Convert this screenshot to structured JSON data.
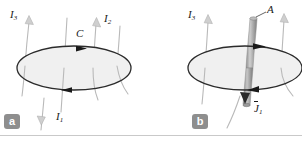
{
  "figure": {
    "background_color": "#ffffff",
    "divider_color": "#c9c9c9",
    "wire_color": "#b9b9b9",
    "contour_color": "#2b2b2b",
    "disk_fill": "#f0f0f0",
    "tube_color": "#9a9a9a",
    "badge_color": "#8e8e8e",
    "badge_text_color": "#ffffff",
    "label_color": "#1a1a1a"
  },
  "panels": [
    {
      "id": "a",
      "badge_label": "a",
      "contour_label": "C",
      "labels": [
        {
          "name": "current-3",
          "text": "I",
          "sub": "3"
        },
        {
          "name": "current-2",
          "text": "I",
          "sub": "2"
        },
        {
          "name": "current-1",
          "text": "I",
          "sub": "1"
        }
      ]
    },
    {
      "id": "b",
      "badge_label": "b",
      "labels": [
        {
          "name": "current-3",
          "text": "I",
          "sub": "3"
        },
        {
          "name": "area",
          "text": "A",
          "sub": ""
        },
        {
          "name": "current-density-1",
          "text": "J",
          "sub": "1",
          "overbar": true
        }
      ]
    }
  ],
  "labels": {
    "a_badge": "a",
    "b_badge": "b",
    "a_I3": "I",
    "a_I3_sub": "3",
    "a_I2": "I",
    "a_I2_sub": "2",
    "a_I1": "I",
    "a_I1_sub": "1",
    "a_C": "C",
    "b_I3": "I",
    "b_I3_sub": "3",
    "b_A": "A",
    "b_J1": "J",
    "b_J1_sub": "1"
  }
}
